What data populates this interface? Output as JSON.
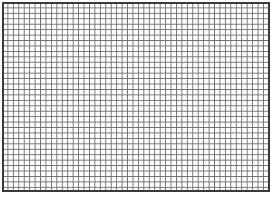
{
  "page": {
    "kind": "graph-paper-grid",
    "width": 278,
    "height": 201,
    "background_color": "#ffffff"
  },
  "grid": {
    "name": "graph-paper",
    "origin_x": 2,
    "origin_y": 2,
    "width": 268,
    "height": 190,
    "cell_size": 5.45,
    "columns": 49,
    "rows": 35,
    "line_color": "#6e6e6e",
    "line_width": 1,
    "fill_color": "#ffffff",
    "border_color": "#3a3a3a",
    "border_width": 2
  },
  "margins": {
    "right_margin": 8,
    "bottom_margin": 9,
    "margin_color": "#ffffff"
  }
}
